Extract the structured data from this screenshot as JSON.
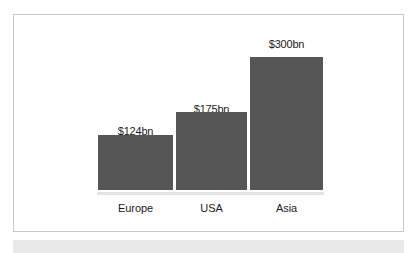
{
  "chart_data": {
    "type": "bar",
    "title": "",
    "subtitle": "",
    "xlabel": "",
    "ylabel": "",
    "categories": [
      "Europe",
      "USA",
      "Asia"
    ],
    "values": [
      124,
      175,
      300
    ],
    "value_labels": [
      "$124bn",
      "$175bn",
      "$300bn"
    ],
    "unit": "bn",
    "currency": "$",
    "ylim": [
      0,
      300
    ],
    "grid": false,
    "legend": null,
    "legend_position": "none",
    "series": [
      {
        "name": "Market size",
        "values": [
          124,
          175,
          300
        ]
      }
    ],
    "bars": [
      {
        "category": "Europe",
        "value": 124,
        "label": "$124bn"
      },
      {
        "category": "USA",
        "value": 175,
        "label": "$175bn"
      },
      {
        "category": "Asia",
        "value": 300,
        "label": "$300bn"
      }
    ],
    "colors": {
      "bar_fill": "#565656",
      "baseline": "#e3e3e3",
      "frame_border": "#c9c9c9",
      "plot_background": "#ffffff",
      "label_text": "#1a1a1a",
      "bottom_strip": "#e9e9e9"
    }
  }
}
